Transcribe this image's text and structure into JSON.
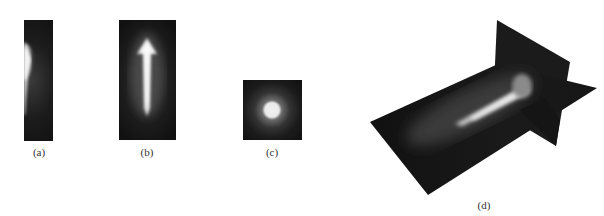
{
  "figure": {
    "panels": [
      {
        "id": "a",
        "label": "(a)",
        "description": "side view of elongated glowing plume, bright arc at left edge"
      },
      {
        "id": "b",
        "label": "(b)",
        "description": "front view of arrow-shaped glowing plume"
      },
      {
        "id": "c",
        "label": "(c)",
        "description": "end-on view: circular bright spot"
      },
      {
        "id": "d",
        "label": "(d)",
        "description": "3D rendering with horizontal and vertical slice planes through the plume"
      }
    ],
    "colors": {
      "background": "#ffffff",
      "panel_dark": "#141414",
      "glow": "#e8e8e8"
    }
  }
}
